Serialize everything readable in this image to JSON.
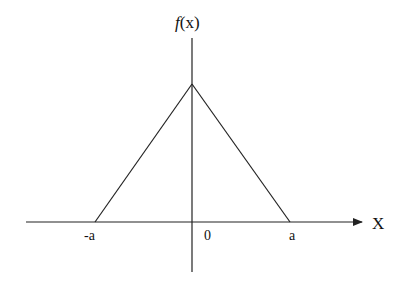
{
  "diagram": {
    "type": "triangular-function-plot",
    "y_axis_label": "f(x)",
    "y_axis_label_parts": {
      "f": "f",
      "paren": "(x)"
    },
    "x_axis_label": "X",
    "tick_labels": {
      "neg_a": "-a",
      "zero": "0",
      "pos_a": "a"
    },
    "function": {
      "description": "triangle pulse: zero outside [-a, a], peak at x = 0",
      "points": [
        {
          "x": "-a",
          "y": 0
        },
        {
          "x": "0",
          "y": "peak"
        },
        {
          "x": "a",
          "y": 0
        }
      ]
    },
    "line_color": "#222222"
  }
}
